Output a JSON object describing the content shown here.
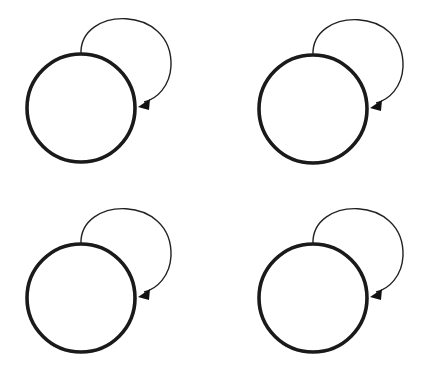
{
  "diagram": {
    "type": "state-graph",
    "background": "#ffffff",
    "stroke_color": "#1a1a1a",
    "nodes": [
      {
        "id": "n1",
        "cx": 81,
        "cy": 108,
        "r": 54,
        "label": "",
        "self_loop": true
      },
      {
        "id": "n2",
        "cx": 313,
        "cy": 109,
        "r": 54,
        "label": "",
        "self_loop": true
      },
      {
        "id": "n3",
        "cx": 81,
        "cy": 298,
        "r": 54,
        "label": "",
        "self_loop": true
      },
      {
        "id": "n4",
        "cx": 313,
        "cy": 298,
        "r": 54,
        "label": "",
        "self_loop": true
      }
    ],
    "edges": [
      {
        "from": "n1",
        "to": "n1",
        "kind": "self-loop",
        "label": ""
      },
      {
        "from": "n2",
        "to": "n2",
        "kind": "self-loop",
        "label": ""
      },
      {
        "from": "n3",
        "to": "n3",
        "kind": "self-loop",
        "label": ""
      },
      {
        "from": "n4",
        "to": "n4",
        "kind": "self-loop",
        "label": ""
      }
    ]
  }
}
